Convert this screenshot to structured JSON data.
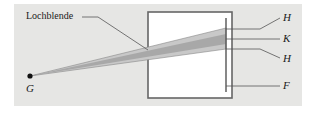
{
  "diagram": {
    "labels": {
      "pinhole": "Lochblende",
      "object_point": "G",
      "half_shadow_top": "H",
      "core_shadow": "K",
      "half_shadow_bottom": "H",
      "screen": "F"
    },
    "colors": {
      "background_panel": "#e6e6e4",
      "box_fill": "#ffffff",
      "line": "#555555",
      "beam_outer": "#c4c4c4",
      "beam_core": "#a8a8a8",
      "text": "#1a1a1a"
    }
  }
}
